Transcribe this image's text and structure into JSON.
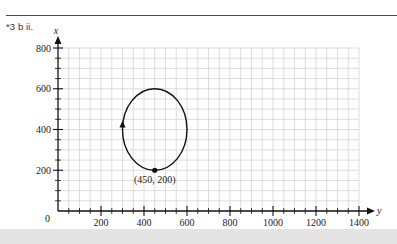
{
  "header": {
    "problem_label": "*3 b ii."
  },
  "chart_data": {
    "type": "line",
    "title": "",
    "xlabel": "y",
    "ylabel": "x",
    "xlim": [
      0,
      1400
    ],
    "ylim": [
      0,
      800
    ],
    "x_ticks": [
      200,
      400,
      600,
      800,
      1000,
      1200,
      1400
    ],
    "y_ticks": [
      200,
      400,
      600,
      800
    ],
    "origin_label": "0",
    "grid": true,
    "grid_minor_step": 50,
    "series": [
      {
        "name": "closed orbit",
        "shape": "ellipse",
        "center": [
          450,
          400
        ],
        "semi_axis_horizontal": 150,
        "semi_axis_vertical": 200,
        "direction": "counterclockwise",
        "direction_arrow_at": [
          300,
          420
        ]
      }
    ],
    "annotations": [
      {
        "text": "(450, 200)",
        "point": [
          450,
          200
        ],
        "marker": "filled-circle"
      }
    ],
    "legend": null
  },
  "colors": {
    "curve": "#111111",
    "grid": "#cfcfcf",
    "axis": "#111111",
    "band": "#e4e4e4"
  }
}
